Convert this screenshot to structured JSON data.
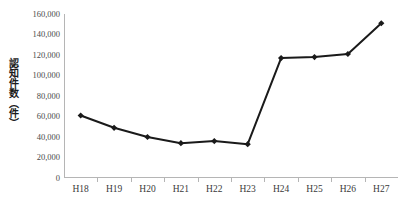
{
  "chart_data": {
    "type": "line",
    "title": "",
    "subtitle": "",
    "xlabel": "",
    "ylabel": "認知件数（件）",
    "categories": [
      "H18",
      "H19",
      "H20",
      "H21",
      "H22",
      "H23",
      "H24",
      "H25",
      "H26",
      "H27"
    ],
    "values": [
      61000,
      49000,
      40000,
      34000,
      36000,
      33000,
      117000,
      118000,
      121000,
      151000
    ],
    "series": [
      {
        "name": "認知件数",
        "values": [
          61000,
          49000,
          40000,
          34000,
          36000,
          33000,
          117000,
          118000,
          121000,
          151000
        ]
      }
    ],
    "ylim": [
      0,
      160000
    ],
    "ytick_values": [
      0,
      20000,
      40000,
      60000,
      80000,
      100000,
      120000,
      140000,
      160000
    ],
    "ytick_labels": [
      "0",
      "20,000",
      "40,000",
      "60,000",
      "80,000",
      "100,000",
      "120,000",
      "140,000",
      "160,000"
    ],
    "grid": false,
    "legend": false,
    "legend_position": "none",
    "marker": "diamond",
    "line_color": "#1a1a1a",
    "marker_color": "#1a1a1a",
    "axis_color": "#b5b5b5",
    "background_color": "#ffffff"
  }
}
